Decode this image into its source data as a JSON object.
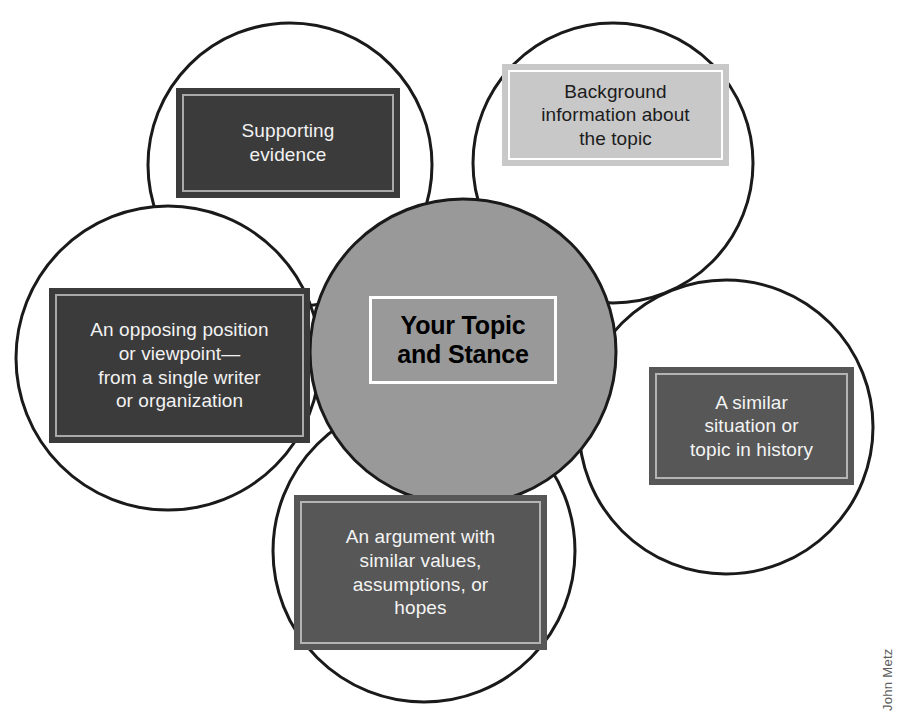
{
  "diagram": {
    "center": {
      "label": "Your Topic\nand Stance",
      "circle_fill": "#999999",
      "circle_stroke": "#1a1a1a",
      "label_border": "#ffffff",
      "label_color": "#000000"
    },
    "petals": [
      {
        "id": "supporting-evidence",
        "label": "Supporting\nevidence",
        "style": "dark",
        "fill": "#3b3b3b",
        "inner_rule": "#a9a9a9",
        "text_color": "#f2f2f2",
        "position": "top-left"
      },
      {
        "id": "background-info",
        "label": "Background\ninformation about\nthe topic",
        "style": "light",
        "fill": "#c8c8c8",
        "inner_rule": "#ffffff",
        "text_color": "#1c1c1c",
        "position": "top-right"
      },
      {
        "id": "opposing-position",
        "label": "An opposing position\nor viewpoint—\nfrom a single writer\nor organization",
        "style": "dark",
        "fill": "#3b3b3b",
        "inner_rule": "#a9a9a9",
        "text_color": "#f2f2f2",
        "position": "left"
      },
      {
        "id": "similar-history",
        "label": "A similar\nsituation or\ntopic in history",
        "style": "mid",
        "fill": "#575757",
        "inner_rule": "#b4b4b4",
        "text_color": "#f4f4f4",
        "position": "right"
      },
      {
        "id": "similar-argument",
        "label": "An argument with\nsimilar values,\nassumptions, or\nhopes",
        "style": "mid",
        "fill": "#575757",
        "inner_rule": "#b4b4b4",
        "text_color": "#f4f4f4",
        "position": "bottom"
      }
    ],
    "circles": {
      "outline_color": "#1a1a1a",
      "outline_width": 3,
      "fill": "#ffffff"
    }
  },
  "credit": {
    "text": "John Metz",
    "color": "#5d5d5d"
  },
  "canvas": {
    "background": "#ffffff",
    "width": 901,
    "height": 719
  }
}
